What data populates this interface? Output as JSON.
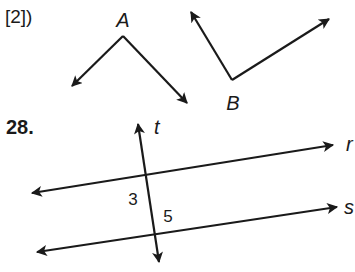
{
  "problem_prefix": "[2])",
  "problem_number": "28.",
  "angle_a": {
    "label": "A",
    "vertex": [
      123,
      36
    ],
    "ray1_tip": [
      72,
      86
    ],
    "ray2_tip": [
      187,
      103
    ],
    "label_pos": [
      123,
      27
    ]
  },
  "angle_b": {
    "label": "B",
    "vertex": [
      232,
      80
    ],
    "ray1_tip": [
      191,
      12
    ],
    "ray2_tip": [
      329,
      19
    ],
    "label_pos": [
      233,
      110
    ]
  },
  "lines": {
    "t": {
      "label": "t",
      "start": [
        159,
        262
      ],
      "end": [
        138,
        124
      ],
      "label_pos": [
        154,
        134
      ]
    },
    "r": {
      "label": "r",
      "start": [
        32,
        193
      ],
      "end": [
        333,
        145
      ],
      "label_pos": [
        346,
        151
      ]
    },
    "s": {
      "label": "s",
      "start": [
        37,
        252
      ],
      "end": [
        337,
        207
      ],
      "label_pos": [
        344,
        214
      ]
    }
  },
  "angle_labels": [
    {
      "label": "3",
      "pos": [
        133,
        205
      ]
    },
    {
      "label": "5",
      "pos": [
        168,
        222
      ]
    }
  ],
  "colors": {
    "ink": "#1a1a1a",
    "background": "#ffffff"
  }
}
